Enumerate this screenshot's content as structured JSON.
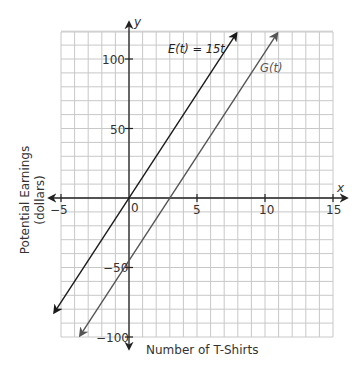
{
  "chart_data": {
    "type": "line",
    "title": "",
    "xlabel": "Number of T-Shirts",
    "ylabel": "Potential Earnings (dollars)",
    "ylabel_lines": [
      "Potential Earnings",
      "(dollars)"
    ],
    "axis_names": {
      "x": "x",
      "y": "y"
    },
    "xlim": [
      -5,
      15
    ],
    "ylim": [
      -100,
      120
    ],
    "grid": true,
    "grid_step": {
      "x": 1,
      "y": 10
    },
    "x_ticks": [
      -5,
      0,
      5,
      10,
      15
    ],
    "x_tick_labels": [
      "-5",
      "0",
      "5",
      "10",
      "15"
    ],
    "y_ticks": [
      100,
      50,
      -50,
      -100
    ],
    "y_tick_labels": [
      "100",
      "50",
      "-50",
      "-100"
    ],
    "origin_label": "0",
    "series": [
      {
        "name": "E(t) = 15t",
        "label_parts": [
          "E",
          "(",
          "t",
          ") = 15",
          "t"
        ],
        "slope": 15,
        "intercept": 0,
        "x": [
          -5.5,
          7.9
        ],
        "y": [
          -82.5,
          118.5
        ],
        "color": "#1a1a1a"
      },
      {
        "name": "G(t)",
        "label_parts": [
          "G",
          "(",
          "t",
          ")"
        ],
        "slope": 15,
        "intercept": -45,
        "x": [
          -3.6,
          10.9
        ],
        "y": [
          -99,
          118.5
        ],
        "color": "#555555"
      }
    ],
    "legend": "inline labels near lines"
  },
  "labels": {
    "origin": "0",
    "x_axis_name": "x",
    "y_axis_name": "y",
    "xlabel": "Number of T-Shirts",
    "ylabel_line1": "Potential Earnings",
    "ylabel_line2": "(dollars)",
    "e_label": "E(t) = 15t",
    "g_label": "G(t)",
    "x_ticks": [
      "−5",
      "5",
      "10",
      "15"
    ],
    "y_ticks": [
      "100",
      "50",
      "−50",
      "−100"
    ]
  }
}
